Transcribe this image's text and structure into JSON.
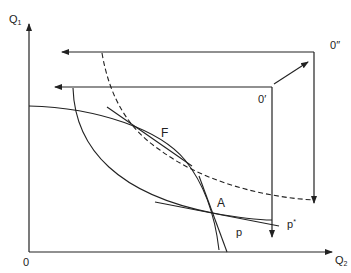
{
  "diagram": {
    "type": "edgeworth-box-production-diagram",
    "axes": {
      "y_label": "Q",
      "y_label_sub": "1",
      "x_label": "Q",
      "x_label_sub": "2",
      "origin_label": "0"
    },
    "origins": {
      "inner_box_label": "0",
      "inner_box_mark": "′",
      "outer_box_label": "0",
      "outer_box_mark": "″"
    },
    "points": {
      "F": "F",
      "A": "A"
    },
    "price_lines": {
      "p": "p",
      "p_star": "p",
      "p_star_mark": "*"
    },
    "colors": {
      "line": "#222222",
      "background": "#ffffff"
    }
  }
}
